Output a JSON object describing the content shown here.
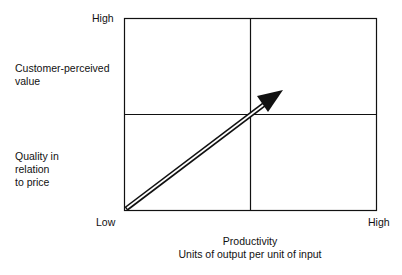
{
  "y_axis": {
    "high_label": "High",
    "low_label": "Low",
    "title_top": "Customer-perceived value",
    "title_top_lines": [
      "Customer-perceived",
      "value"
    ],
    "title_bottom_lines": [
      "Quality in",
      "relation",
      "to price"
    ]
  },
  "x_axis": {
    "high_label": "High",
    "title": "Productivity",
    "subtitle": "Units of output per unit of input"
  },
  "grid": {
    "quadrants": 4,
    "line_color": "#111111"
  },
  "arrow": {
    "direction": "low-low to high-high (upper-right)",
    "style": "double-line shaft with filled arrowhead",
    "color": "#111111"
  }
}
